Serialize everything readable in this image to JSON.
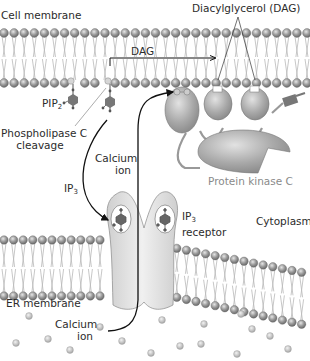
{
  "diagram": {
    "labels": {
      "cell_membrane": "Cell membrane",
      "dag_full": "Diacylglycerol (DAG)",
      "dag_short": "DAG",
      "pip2_base": "PIP",
      "pip2_sub": "2",
      "phospholipase_line1": "Phospholipase C",
      "phospholipase_line2": "cleavage",
      "ip3_base": "IP",
      "ip3_sub": "3",
      "calcium_top_line1": "Calcium",
      "calcium_top_line2": "ion",
      "protein_kinase_c": "Protein kinase C",
      "ip3_receptor_base": "IP",
      "ip3_receptor_sub": "3",
      "ip3_receptor_line2": "receptor",
      "cytoplasm": "Cytoplasm",
      "er_membrane": "ER membrane",
      "calcium_bottom_line1": "Calcium",
      "calcium_bottom_line2": "ion"
    },
    "colors": {
      "lipid_head": "#8c8c8c",
      "lipid_tail": "#b5b5b5",
      "protein_fill": "#a9a9a9",
      "receptor_fill": "#dedede",
      "text": "#2b2b2b",
      "label_grey": "#8a8a8a",
      "arrow": "#111111"
    },
    "nodes": [
      "Cell membrane",
      "PIP2",
      "Phospholipase C",
      "DAG",
      "IP3",
      "IP3 receptor",
      "ER membrane",
      "Calcium ion",
      "Protein kinase C",
      "Cytoplasm"
    ],
    "edges": [
      {
        "from": "PIP2",
        "to": "DAG",
        "label": "Phospholipase C cleavage"
      },
      {
        "from": "PIP2",
        "to": "IP3",
        "label": "Phospholipase C cleavage"
      },
      {
        "from": "DAG",
        "to": "Protein kinase C",
        "label": "DAG"
      },
      {
        "from": "IP3",
        "to": "IP3 receptor",
        "label": "IP3"
      },
      {
        "from": "ER membrane",
        "to": "Protein kinase C",
        "label": "Calcium ion"
      }
    ]
  }
}
